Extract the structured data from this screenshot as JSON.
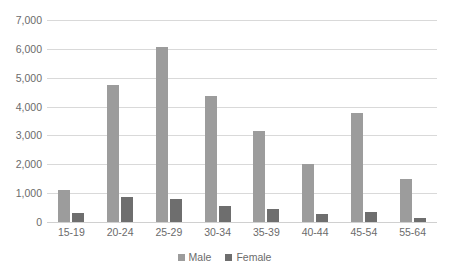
{
  "chart_data": {
    "type": "bar",
    "title": "",
    "subtitle": "",
    "xlabel": "",
    "ylabel": "",
    "categories": [
      "15-19",
      "20-24",
      "25-29",
      "30-34",
      "35-39",
      "40-44",
      "45-54",
      "55-64"
    ],
    "series": [
      {
        "name": "Male",
        "color": "#9c9c9c",
        "values": [
          1100,
          4750,
          6080,
          4350,
          3170,
          2000,
          3780,
          1480
        ]
      },
      {
        "name": "Female",
        "color": "#6e6e6e",
        "values": [
          310,
          870,
          790,
          560,
          450,
          290,
          340,
          130
        ]
      }
    ],
    "ylim": [
      0,
      7000
    ],
    "ytick_values": [
      0,
      1000,
      2000,
      3000,
      4000,
      5000,
      6000,
      7000
    ],
    "ytick_labels": [
      "0",
      "1,000",
      "2,000",
      "3,000",
      "4,000",
      "5,000",
      "6,000",
      "7,000"
    ],
    "grid": true,
    "grid_axis": "y",
    "legend": true,
    "legend_position": "bottom",
    "legend_entries": [
      "Male",
      "Female"
    ],
    "axis_label_color": "#6b6b6b",
    "gridline_color": "#d9d9d9",
    "background_color": "#ffffff"
  }
}
